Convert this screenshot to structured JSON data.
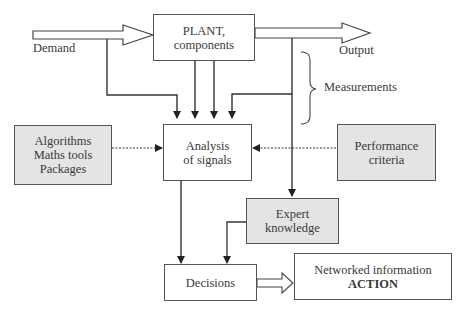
{
  "diagram": {
    "nodes": {
      "plant": {
        "line1": "PLANT,",
        "line2": "components"
      },
      "analysis": {
        "line1": "Analysis",
        "line2": "of signals"
      },
      "algorithms": {
        "line1": "Algorithms",
        "line2": "Maths tools",
        "line3": "Packages"
      },
      "performance": {
        "line1": "Performance",
        "line2": "criteria"
      },
      "expert": {
        "line1": "Expert",
        "line2": "knowledge"
      },
      "decisions": {
        "label": "Decisions"
      },
      "action": {
        "line1": "Networked information",
        "line2": "ACTION"
      }
    },
    "labels": {
      "demand": "Demand",
      "output": "Output",
      "measurements": "Measurements"
    },
    "colors": {
      "line": "#333333",
      "grey_box_fill": "#e4e4e4",
      "box_border": "#555555"
    }
  }
}
